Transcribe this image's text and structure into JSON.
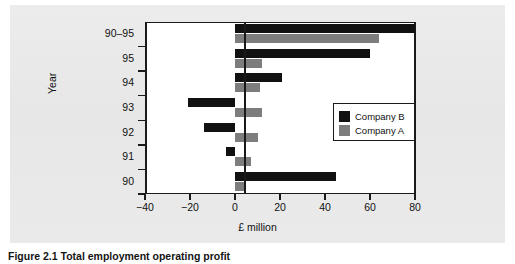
{
  "figure": {
    "caption": "Figure 2.1  Total employment operating profit",
    "background_color": "#e9e9e9",
    "plot_background_color": "#ffffff",
    "axis_color": "#1a1a1a"
  },
  "legend": {
    "position": "inside-right",
    "entries": [
      {
        "label": "Company B",
        "color": "#111111"
      },
      {
        "label": "Company A",
        "color": "#7d7d7d"
      }
    ]
  },
  "chart_data": {
    "type": "bar",
    "orientation": "horizontal",
    "title": "",
    "subtitle": "",
    "xlabel": "£ million",
    "ylabel": "Year",
    "categories": [
      "90–95",
      "95",
      "94",
      "93",
      "92",
      "91",
      "90"
    ],
    "series": [
      {
        "name": "Company B",
        "color": "#111111",
        "values": [
          80,
          60,
          21,
          -21,
          -14,
          -4,
          45
        ]
      },
      {
        "name": "Company A",
        "color": "#7d7d7d",
        "values": [
          64,
          12,
          11,
          12,
          10,
          7,
          5
        ]
      }
    ],
    "xlim": [
      -40,
      80
    ],
    "xticks": [
      -40,
      -20,
      0,
      20,
      40,
      60,
      80
    ],
    "xtick_labels": [
      "−40",
      "−20",
      "0",
      "20",
      "40",
      "60",
      "80"
    ],
    "ytick_labels": [
      "90–95",
      "95",
      "94",
      "93",
      "92",
      "91",
      "90"
    ],
    "grid": false,
    "zero_line": 0
  }
}
